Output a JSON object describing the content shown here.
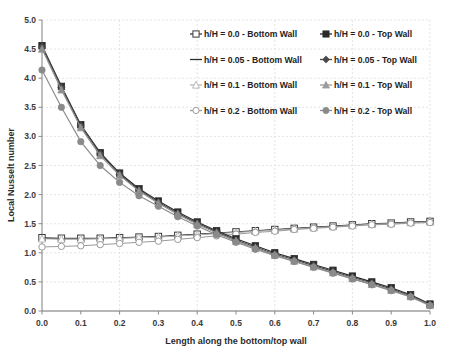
{
  "chart_data": {
    "type": "line",
    "title": "",
    "xlabel": "Length along the bottom/top wall",
    "ylabel": "Local Nusselt number",
    "xlim": [
      0.0,
      1.0
    ],
    "ylim": [
      0.0,
      5.0
    ],
    "xticks": [
      "0.0",
      "0.1",
      "0.2",
      "0.3",
      "0.4",
      "0.5",
      "0.6",
      "0.7",
      "0.8",
      "0.9",
      "1.0"
    ],
    "yticks": [
      "0.0",
      "0.5",
      "1.0",
      "1.5",
      "2.0",
      "2.5",
      "3.0",
      "3.5",
      "4.0",
      "4.5",
      "5.0"
    ],
    "grid": true,
    "grid_style": "dashed-light",
    "legend_position": "upper-right-inside",
    "x": [
      0.0,
      0.05,
      0.1,
      0.15,
      0.2,
      0.25,
      0.3,
      0.35,
      0.4,
      0.45,
      0.5,
      0.55,
      0.6,
      0.65,
      0.7,
      0.75,
      0.8,
      0.85,
      0.9,
      0.95,
      1.0
    ],
    "series": [
      {
        "name": "h/H = 0.0 - Bottom Wall",
        "wall": "bottom",
        "marker": "open-square",
        "color": "#3a3a3a",
        "values": [
          1.26,
          1.25,
          1.25,
          1.25,
          1.26,
          1.27,
          1.28,
          1.3,
          1.32,
          1.34,
          1.36,
          1.38,
          1.4,
          1.42,
          1.44,
          1.46,
          1.48,
          1.5,
          1.51,
          1.53,
          1.54
        ]
      },
      {
        "name": "h/H = 0.05 - Bottom Wall",
        "wall": "bottom",
        "marker": "none",
        "color": "#303030",
        "values": [
          1.25,
          1.24,
          1.24,
          1.245,
          1.255,
          1.265,
          1.275,
          1.295,
          1.315,
          1.335,
          1.355,
          1.375,
          1.395,
          1.415,
          1.435,
          1.455,
          1.475,
          1.495,
          1.505,
          1.525,
          1.535
        ]
      },
      {
        "name": "h/H = 0.1 - Bottom Wall",
        "wall": "bottom",
        "marker": "open-triangle",
        "color": "#b8b8b8",
        "values": [
          1.24,
          1.235,
          1.235,
          1.24,
          1.25,
          1.26,
          1.27,
          1.29,
          1.31,
          1.33,
          1.35,
          1.37,
          1.39,
          1.41,
          1.43,
          1.45,
          1.47,
          1.49,
          1.5,
          1.52,
          1.53
        ]
      },
      {
        "name": "h/H = 0.2 - Bottom Wall",
        "wall": "bottom",
        "marker": "open-circle",
        "color": "#9a9a9a",
        "values": [
          1.1,
          1.11,
          1.12,
          1.14,
          1.16,
          1.18,
          1.2,
          1.23,
          1.26,
          1.29,
          1.32,
          1.35,
          1.37,
          1.4,
          1.42,
          1.44,
          1.46,
          1.48,
          1.49,
          1.51,
          1.52
        ]
      },
      {
        "name": "h/H = 0.0 - Top Wall",
        "wall": "top",
        "marker": "filled-square",
        "color": "#2b2b2b",
        "values": [
          4.56,
          3.86,
          3.2,
          2.72,
          2.37,
          2.1,
          1.89,
          1.7,
          1.53,
          1.38,
          1.24,
          1.12,
          1.0,
          0.9,
          0.8,
          0.7,
          0.6,
          0.5,
          0.4,
          0.28,
          0.12
        ]
      },
      {
        "name": "h/H = 0.05 - Top Wall",
        "wall": "top",
        "marker": "filled-diamond",
        "color": "#4a4a4a",
        "values": [
          4.54,
          3.84,
          3.18,
          2.7,
          2.35,
          2.08,
          1.87,
          1.68,
          1.51,
          1.36,
          1.22,
          1.1,
          0.98,
          0.88,
          0.78,
          0.68,
          0.58,
          0.48,
          0.38,
          0.26,
          0.11
        ]
      },
      {
        "name": "h/H = 0.1 - Top Wall",
        "wall": "top",
        "marker": "filled-triangle",
        "color": "#8f8f8f",
        "values": [
          4.5,
          3.8,
          3.15,
          2.67,
          2.33,
          2.06,
          1.85,
          1.66,
          1.49,
          1.34,
          1.2,
          1.08,
          0.96,
          0.86,
          0.76,
          0.66,
          0.56,
          0.46,
          0.36,
          0.25,
          0.1
        ]
      },
      {
        "name": "h/H = 0.2 - Top Wall",
        "wall": "top",
        "marker": "filled-circle",
        "color": "#8a8a8a",
        "values": [
          4.14,
          3.5,
          2.91,
          2.5,
          2.21,
          1.98,
          1.8,
          1.62,
          1.46,
          1.31,
          1.18,
          1.06,
          0.95,
          0.85,
          0.75,
          0.65,
          0.55,
          0.45,
          0.35,
          0.24,
          0.09
        ]
      }
    ]
  },
  "legend": {
    "entries": [
      {
        "label": "h/H = 0.0 - Bottom Wall",
        "marker": "open-square",
        "color": "#3a3a3a",
        "col": 0,
        "row": 0
      },
      {
        "label": "h/H = 0.0 - Top Wall",
        "marker": "filled-square",
        "color": "#2b2b2b",
        "col": 1,
        "row": 0
      },
      {
        "label": "h/H = 0.05 - Bottom Wall",
        "marker": "none",
        "color": "#303030",
        "col": 0,
        "row": 1
      },
      {
        "label": "h/H = 0.05 - Top Wall",
        "marker": "filled-diamond",
        "color": "#4a4a4a",
        "col": 1,
        "row": 1
      },
      {
        "label": "h/H = 0.1 - Bottom Wall",
        "marker": "open-triangle",
        "color": "#b8b8b8",
        "col": 0,
        "row": 2
      },
      {
        "label": "h/H = 0.1 - Top Wall",
        "marker": "filled-triangle",
        "color": "#9c9c9c",
        "col": 1,
        "row": 2
      },
      {
        "label": "h/H = 0.2 - Bottom Wall",
        "marker": "open-circle",
        "color": "#9a9a9a",
        "col": 0,
        "row": 3
      },
      {
        "label": "h/H = 0.2 - Top Wall",
        "marker": "filled-circle",
        "color": "#8a8a8a",
        "col": 1,
        "row": 3
      }
    ]
  },
  "axes": {
    "x_title": "Length along the bottom/top wall",
    "y_title": "Local Nusselt number"
  }
}
